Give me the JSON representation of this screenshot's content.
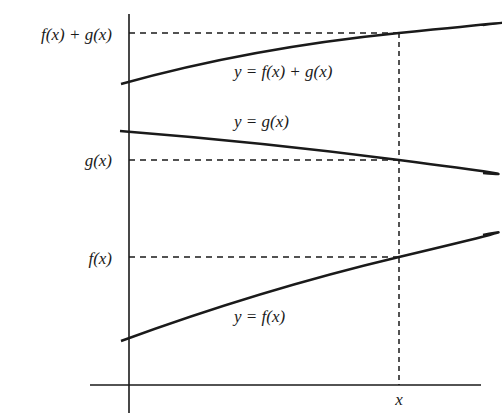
{
  "diagram": {
    "type": "function-sum-illustration",
    "colors": {
      "background": "#ffffff",
      "stroke": "#1a1a1a"
    },
    "axes": {
      "x_axis_label": "x",
      "y_axis_tick_labels": {
        "sum": {
          "parts": [
            "f",
            "(",
            "x",
            ") + g(",
            "x",
            ")"
          ],
          "text": "f(x) + g(x)"
        },
        "g": {
          "text": "g(x)"
        },
        "f": {
          "text": "f(x)"
        }
      }
    },
    "curves": [
      {
        "id": "sum",
        "label_text": "y = f(x) + g(x)",
        "start": [
          121,
          84
        ],
        "end": [
          483,
          25
        ]
      },
      {
        "id": "g",
        "label_text": "y = g(x)",
        "start": [
          120,
          131
        ],
        "end": [
          483,
          173
        ]
      },
      {
        "id": "f",
        "label_text": "y = f(x)",
        "start": [
          121,
          341
        ],
        "end": [
          483,
          235
        ]
      }
    ],
    "marker_x_label": "x",
    "labels": {
      "sum_left": "f(x) + g(x)",
      "g_left": "g(x)",
      "f_left": "f(x)",
      "sum_curve": "y = f(x) + g(x)",
      "g_curve": "y = g(x)",
      "f_curve": "y = f(x)",
      "x_tick": "x"
    }
  }
}
